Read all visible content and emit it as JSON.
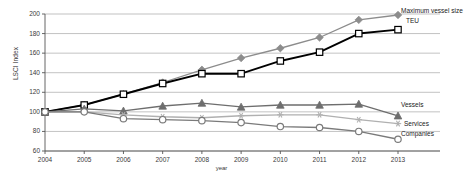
{
  "chart_data": {
    "type": "line",
    "title": "",
    "xlabel": "year",
    "ylabel": "LSCI Index",
    "categories": [
      2004,
      2005,
      2006,
      2007,
      2008,
      2009,
      2010,
      2011,
      2012,
      2013
    ],
    "x_tick_labels": [
      "2004",
      "2005",
      "2006",
      "2007",
      "2008",
      "2009",
      "2010",
      "2011",
      "2012",
      "2013"
    ],
    "y_tick_labels": [
      "60",
      "80",
      "100",
      "120",
      "140",
      "160",
      "180",
      "200"
    ],
    "y_ticks": [
      60,
      80,
      100,
      120,
      140,
      160,
      180,
      200
    ],
    "ylim": [
      60,
      200
    ],
    "grid": true,
    "legend_position": "right",
    "series": [
      {
        "name": "Maximum vessel size",
        "legend_label_line1": "Maximum vessel size",
        "legend_label_line2": "TEU",
        "marker": "diamond",
        "color": "#8c8c8c",
        "values": [
          100,
          107,
          118,
          130,
          143,
          155,
          165,
          176,
          194,
          199
        ]
      },
      {
        "name": "TEU",
        "legend_label": "TEU",
        "marker": "square",
        "color": "#000000",
        "values": [
          100,
          107,
          118,
          129,
          139,
          139,
          152,
          161,
          180,
          184
        ]
      },
      {
        "name": "Vessels",
        "legend_label": "Vessels",
        "marker": "triangle",
        "color": "#6e6e6e",
        "values": [
          100,
          103,
          101,
          106,
          109,
          105,
          107,
          107,
          108,
          96
        ]
      },
      {
        "name": "Services",
        "legend_label": "Services",
        "marker": "star",
        "color": "#b0b0b0",
        "values": [
          100,
          100,
          97,
          95,
          94,
          96,
          97,
          97,
          92,
          88
        ]
      },
      {
        "name": "Companies",
        "legend_label": "Companies",
        "marker": "circle",
        "color": "#7a7a7a",
        "values": [
          100,
          100,
          93,
          92,
          91,
          89,
          85,
          84,
          80,
          72
        ]
      }
    ]
  },
  "axis": {
    "y_title": "LSCI Index",
    "x_title": "year"
  },
  "legend": {
    "maximum_vessel_size": "Maximum vessel size",
    "teu": "TEU",
    "vessels": "Vessels",
    "services": "Services",
    "companies": "Companies"
  }
}
